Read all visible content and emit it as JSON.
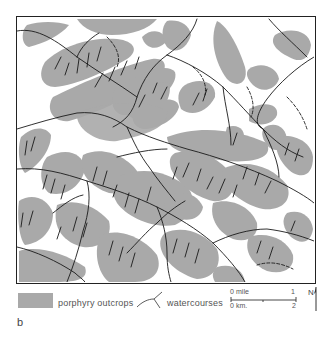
{
  "figure": {
    "label": "b",
    "colors": {
      "outcrop": "#a9a9a9",
      "watercourse": "#1a1a1a",
      "frame": "#222222",
      "background": "#ffffff"
    }
  },
  "legend": {
    "items": [
      {
        "symbol": "gray-fill",
        "label": "porphyry outcrops"
      },
      {
        "symbol": "branching-line",
        "label": "watercourses"
      }
    ]
  },
  "scale_bar": {
    "mile": {
      "start": "0",
      "unit": "mile",
      "end": "1"
    },
    "km": {
      "start": "0",
      "unit": "km.",
      "end": "2"
    }
  },
  "north_arrow": {
    "label": "N"
  }
}
